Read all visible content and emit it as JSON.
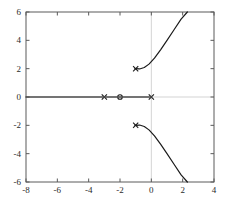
{
  "chart_data": {
    "type": "scatter",
    "title": "",
    "xlabel": "",
    "ylabel": "",
    "xlim": [
      -8,
      4
    ],
    "ylim": [
      -6,
      6
    ],
    "grid": false,
    "legend": null,
    "xticks": [
      -8,
      -6,
      -4,
      -2,
      0,
      2,
      4
    ],
    "xtick_labels": [
      "-8",
      "-6",
      "-4",
      "-2",
      "0",
      "2",
      "4"
    ],
    "yticks": [
      -6,
      -4,
      -2,
      0,
      2,
      4,
      6
    ],
    "ytick_labels": [
      "-6",
      "-4",
      "-2",
      "0",
      "2",
      "4",
      "6"
    ],
    "series": [
      {
        "name": "poles",
        "marker": "x",
        "color": "#1a1a1a",
        "points": [
          {
            "x": -3,
            "y": 0
          },
          {
            "x": 0,
            "y": 0
          },
          {
            "x": -1,
            "y": 2
          },
          {
            "x": -1,
            "y": -2
          }
        ]
      },
      {
        "name": "zeros",
        "marker": "o",
        "color": "#1a1a1a",
        "points": [
          {
            "x": -2,
            "y": 0
          }
        ]
      },
      {
        "name": "real-axis-locus",
        "marker": "line",
        "color": "#4d4d4d",
        "points": [
          {
            "x": -8,
            "y": 0
          },
          {
            "x": 0,
            "y": 0
          }
        ]
      },
      {
        "name": "upper-branch",
        "marker": "line",
        "color": "#1a1a1a",
        "points": [
          {
            "x": -1.05,
            "y": 2.0
          },
          {
            "x": -0.75,
            "y": 1.98
          },
          {
            "x": -0.45,
            "y": 2.08
          },
          {
            "x": -0.15,
            "y": 2.32
          },
          {
            "x": 0.2,
            "y": 2.75
          },
          {
            "x": 0.6,
            "y": 3.35
          },
          {
            "x": 1.0,
            "y": 4.0
          },
          {
            "x": 1.45,
            "y": 4.75
          },
          {
            "x": 1.9,
            "y": 5.5
          },
          {
            "x": 2.3,
            "y": 6.0
          }
        ]
      },
      {
        "name": "lower-branch",
        "marker": "line",
        "color": "#1a1a1a",
        "points": [
          {
            "x": -1.05,
            "y": -2.0
          },
          {
            "x": -0.75,
            "y": -1.98
          },
          {
            "x": -0.45,
            "y": -2.08
          },
          {
            "x": -0.15,
            "y": -2.32
          },
          {
            "x": 0.2,
            "y": -2.75
          },
          {
            "x": 0.6,
            "y": -3.35
          },
          {
            "x": 1.0,
            "y": -4.0
          },
          {
            "x": 1.45,
            "y": -4.75
          },
          {
            "x": 1.9,
            "y": -5.5
          },
          {
            "x": 2.3,
            "y": -6.0
          }
        ]
      }
    ],
    "axis_lines": {
      "x_zero": 0,
      "y_zero": 0,
      "color": "#c8c8c8"
    }
  },
  "caption": {
    "text": ""
  }
}
